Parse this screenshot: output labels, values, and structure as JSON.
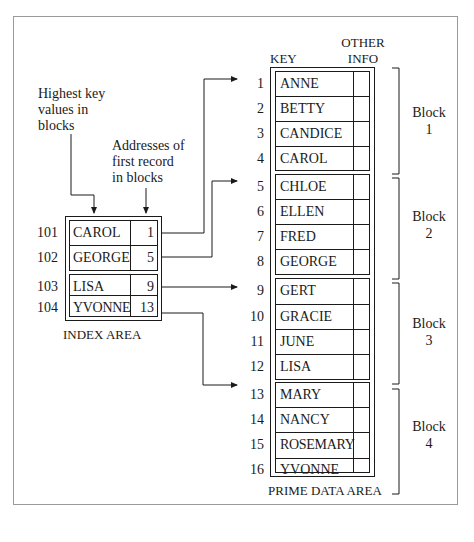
{
  "diagram": {
    "annotations": {
      "highest_keys": [
        "Highest key",
        "values in",
        "blocks"
      ],
      "first_addresses": [
        "Addresses of",
        "first record",
        "in blocks"
      ]
    },
    "index_area": {
      "label": "INDEX AREA",
      "rows": [
        {
          "addr": "101",
          "key": "CAROL",
          "pointer": "1"
        },
        {
          "addr": "102",
          "key": "GEORGE",
          "pointer": "5"
        },
        {
          "addr": "103",
          "key": "LISA",
          "pointer": "9"
        },
        {
          "addr": "104",
          "key": "YVONNE",
          "pointer": "13"
        }
      ]
    },
    "prime_area": {
      "label": "PRIME DATA AREA",
      "header_key": "KEY",
      "header_other": [
        "OTHER",
        "INFO"
      ],
      "records": [
        {
          "n": "1",
          "key": "ANNE"
        },
        {
          "n": "2",
          "key": "BETTY"
        },
        {
          "n": "3",
          "key": "CANDICE"
        },
        {
          "n": "4",
          "key": "CAROL"
        },
        {
          "n": "5",
          "key": "CHLOE"
        },
        {
          "n": "6",
          "key": "ELLEN"
        },
        {
          "n": "7",
          "key": "FRED"
        },
        {
          "n": "8",
          "key": "GEORGE"
        },
        {
          "n": "9",
          "key": "GERT"
        },
        {
          "n": "10",
          "key": "GRACIE"
        },
        {
          "n": "11",
          "key": "JUNE"
        },
        {
          "n": "12",
          "key": "LISA"
        },
        {
          "n": "13",
          "key": "MARY"
        },
        {
          "n": "14",
          "key": "NANCY"
        },
        {
          "n": "15",
          "key": "ROSEMARY"
        },
        {
          "n": "16",
          "key": "YVONNE"
        }
      ],
      "blocks": [
        {
          "word": "Block",
          "n": "1"
        },
        {
          "word": "Block",
          "n": "2"
        },
        {
          "word": "Block",
          "n": "3"
        },
        {
          "word": "Block",
          "n": "4"
        }
      ]
    },
    "colors": {
      "line": "#1a1a1a",
      "frame": "#9a9a9a"
    }
  }
}
